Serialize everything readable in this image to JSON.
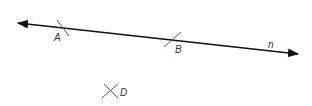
{
  "diagram": {
    "line": {
      "name": "n",
      "label": "n"
    },
    "points": [
      {
        "id": "A",
        "label": "A"
      },
      {
        "id": "B",
        "label": "B"
      },
      {
        "id": "D",
        "label": "D"
      }
    ],
    "colors": {
      "line": "#111111",
      "tick": "#555555",
      "label": "#333333"
    }
  }
}
